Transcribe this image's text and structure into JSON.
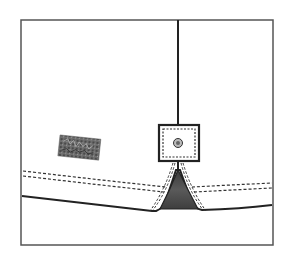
{
  "diagram": {
    "type": "technical-flat-sketch",
    "colors": {
      "background": "#ffffff",
      "frame": "#555555",
      "outline": "#222222",
      "stitch": "#333333",
      "gusset_fill": "#4a4a4a",
      "label_fill": "#6a6a6a"
    },
    "components": [
      {
        "id": "frame",
        "label": ""
      },
      {
        "id": "placket-seam",
        "label": ""
      },
      {
        "id": "button-box",
        "label": ""
      },
      {
        "id": "button",
        "label": ""
      },
      {
        "id": "gusset",
        "label": ""
      },
      {
        "id": "hem-stitching",
        "label": ""
      },
      {
        "id": "hem-edge",
        "label": ""
      },
      {
        "id": "brand-label",
        "label": ""
      }
    ]
  }
}
